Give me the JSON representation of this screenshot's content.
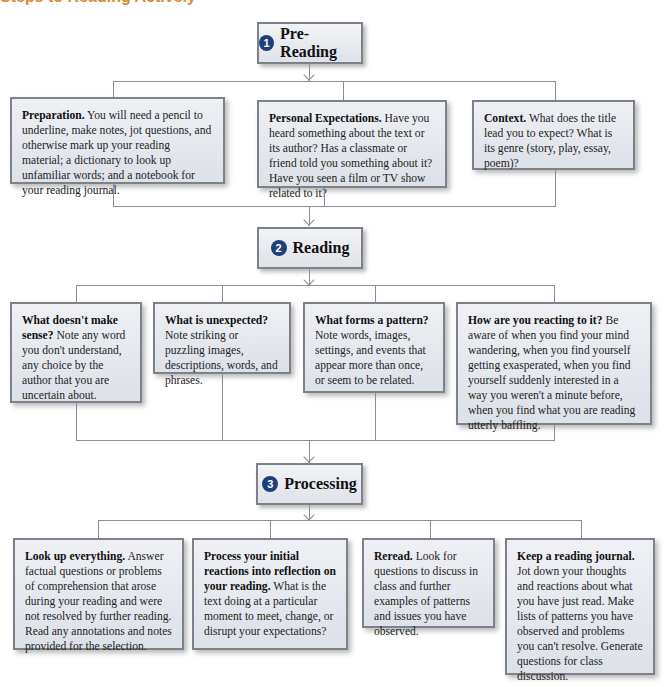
{
  "header": {
    "title_partial": "Steps to Reading Actively"
  },
  "colors": {
    "title": "#d98a2b",
    "number_badge": "#1f3f7a",
    "box_border": "#7d818a",
    "connector": "#8a8d95"
  },
  "stages": [
    {
      "number": "1",
      "label": "Pre-Reading",
      "items": [
        {
          "heading": "Preparation.",
          "body": " You will need a pencil to underline, make notes, jot questions, and otherwise mark up your reading material; a dictionary to look up unfamiliar words; and a notebook for your reading journal."
        },
        {
          "heading": "Personal Expectations.",
          "body": " Have you heard something about the text or its author? Has a classmate or friend told you something about it? Have you seen a film or TV show related to it?"
        },
        {
          "heading": "Context.",
          "body": " What does the title lead you to expect? What is its genre  (story, play, essay, poem)?"
        }
      ]
    },
    {
      "number": "2",
      "label": "Reading",
      "items": [
        {
          "heading": "What doesn't make sense?",
          "body": " Note any word you don't understand, any choice by the author that you are uncertain about."
        },
        {
          "heading": "What is unexpected?",
          "body": " Note striking or puzzling images, descriptions, words, and phrases."
        },
        {
          "heading": "What forms a pattern?",
          "body": " Note words, images, settings, and events that appear more than once, or seem to be related."
        },
        {
          "heading": "How are you reacting to it?",
          "body": " Be aware of when you find your mind wandering, when you find yourself getting exasperated, when you find yourself suddenly interested in a way you weren't a minute before, when you find what you are reading utterly baffling."
        }
      ]
    },
    {
      "number": "3",
      "label": "Processing",
      "items": [
        {
          "heading": "Look up everything.",
          "body": " Answer factual questions or problems of comprehension that arose during your reading and were not resolved by further reading. Read any annotations and notes provided for the selection."
        },
        {
          "heading": "Process your initial reactions into reflection on your reading.",
          "body": " What is the text doing at a particular moment to meet, change, or disrupt your expectations?"
        },
        {
          "heading": "Reread.",
          "body": " Look for questions to discuss in class and further examples of patterns and issues you have observed."
        },
        {
          "heading": "Keep a reading journal.",
          "body": " Jot down your thoughts and reactions about what you have just read. Make lists of patterns you have observed and problems you can't resolve. Generate questions for class discussion."
        }
      ]
    }
  ]
}
